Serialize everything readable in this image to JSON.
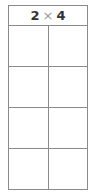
{
  "header": {
    "cols": "2",
    "times": "×",
    "rows": "4"
  },
  "grid": {
    "columns": 2,
    "rows": 4
  }
}
